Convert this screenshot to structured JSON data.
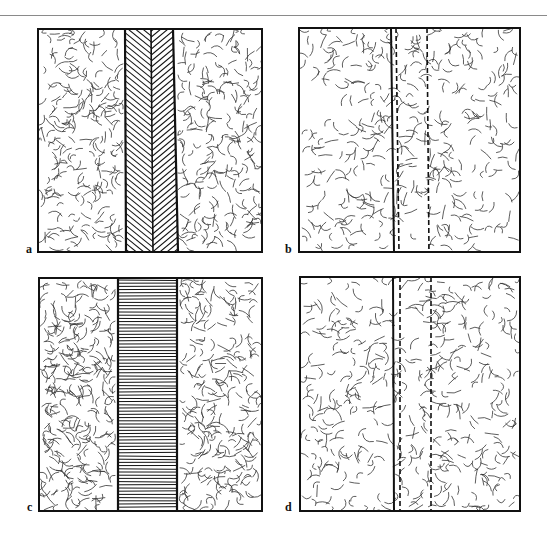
{
  "figure": {
    "panels": [
      {
        "id": "a",
        "label": "a",
        "band_type": "herringbone-hatched",
        "boundary_lines": [
          "solid",
          "center-solid",
          "solid"
        ]
      },
      {
        "id": "b",
        "label": "b",
        "band_type": "open",
        "boundary_lines": [
          "solid",
          "dashed",
          "dashed"
        ]
      },
      {
        "id": "c",
        "label": "c",
        "band_type": "horizontal-hatched",
        "boundary_lines": [
          "solid",
          "solid"
        ]
      },
      {
        "id": "d",
        "label": "d",
        "band_type": "open",
        "boundary_lines": [
          "solid",
          "dashed",
          "dashed"
        ]
      }
    ],
    "texture": "random curly fibers",
    "colors": {
      "ink": "#111111",
      "fiber": "#333333",
      "rule": "#8a8a8a",
      "background": "#ffffff"
    }
  }
}
